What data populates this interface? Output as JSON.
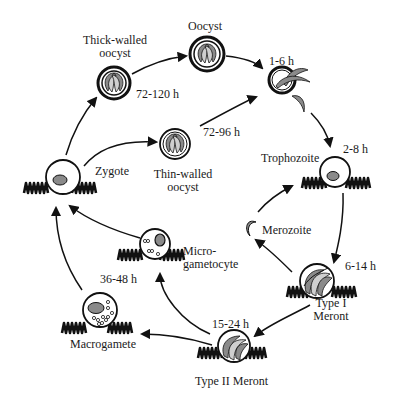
{
  "diagram": {
    "title": "",
    "stages": [
      {
        "id": "thick-walled-oocyst",
        "label_line1": "Thick-walled",
        "label_line2": "oocyst",
        "time": "72-120 h"
      },
      {
        "id": "oocyst",
        "label": "Oocyst"
      },
      {
        "id": "excystation",
        "time": "1-6 h"
      },
      {
        "id": "trophozoite",
        "label": "Trophozoite",
        "time": "2-8 h"
      },
      {
        "id": "type-i-meront",
        "label_line1": "Type I",
        "label_line2": "Meront",
        "time": "6-14 h"
      },
      {
        "id": "merozoite",
        "label": "Merozoite"
      },
      {
        "id": "type-ii-meront",
        "label": "Type II Meront",
        "time": "15-24 h"
      },
      {
        "id": "macrogamete",
        "label": "Macrogamete",
        "time": "36-48 h"
      },
      {
        "id": "microgametocyte",
        "label_line1": "Micro-",
        "label_line2": "gametocyte"
      },
      {
        "id": "zygote",
        "label": "Zygote"
      },
      {
        "id": "thin-walled-oocyst",
        "label_line1": "Thin-walled",
        "label_line2": "oocyst",
        "time": "72-96 h"
      }
    ],
    "colors": {
      "stroke": "#111111",
      "fill_gray": "#8a8a8a",
      "fill_light": "#d0d0d0",
      "background": "#ffffff"
    }
  }
}
